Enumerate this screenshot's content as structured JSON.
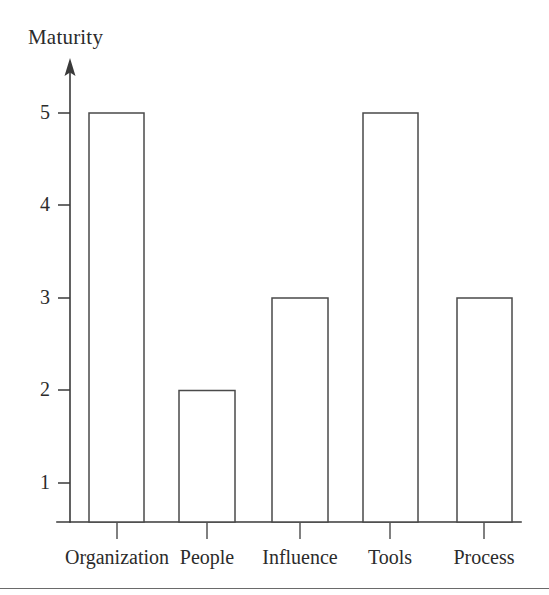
{
  "figure": {
    "background_color": "#ffffff",
    "stroke_color": "#4a4a4a",
    "text_color": "#2b2b2b",
    "bottom_rule_color": "#6a6a6a"
  },
  "chart_data": {
    "type": "bar",
    "title": "",
    "ylabel": "Maturity",
    "xlabel": "",
    "categories": [
      "Organization",
      "People",
      "Influence",
      "Tools",
      "Process"
    ],
    "values": [
      5,
      2,
      3,
      5,
      3
    ],
    "ytick_labels": [
      "1",
      "2",
      "3",
      "4",
      "5"
    ],
    "ytick_values": [
      1,
      2,
      3,
      4,
      5
    ],
    "ylim": [
      0,
      5.6
    ],
    "grid": false,
    "legend": null,
    "bar_style": "outlined-unfilled",
    "axis_arrow": "up"
  },
  "axis": {
    "y_title": "Maturity",
    "y_ticks": [
      {
        "label": "5",
        "value": 5
      },
      {
        "label": "4",
        "value": 4
      },
      {
        "label": "3",
        "value": 3
      },
      {
        "label": "2",
        "value": 2
      },
      {
        "label": "1",
        "value": 1
      }
    ],
    "x_ticks": [
      {
        "label": "Organization"
      },
      {
        "label": "People"
      },
      {
        "label": "Influence"
      },
      {
        "label": "Tools"
      },
      {
        "label": "Process"
      }
    ]
  },
  "bars": [
    {
      "category": "Organization",
      "value": 5
    },
    {
      "category": "People",
      "value": 2
    },
    {
      "category": "Influence",
      "value": 3
    },
    {
      "category": "Tools",
      "value": 5
    },
    {
      "category": "Process",
      "value": 3
    }
  ]
}
